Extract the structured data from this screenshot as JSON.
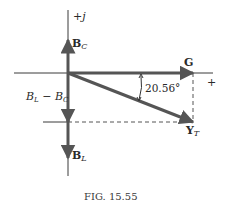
{
  "figure": {
    "caption": "FIG. 15.55",
    "axes": {
      "imag_label": "+j",
      "real_label": "+"
    },
    "vectors": {
      "bc": {
        "main": "B",
        "sub": "C"
      },
      "bl": {
        "main": "B",
        "sub": "L"
      },
      "g": {
        "main": "G"
      },
      "yt": {
        "main": "Y",
        "sub": "T"
      }
    },
    "difference_label": "B_L − B_C",
    "difference": {
      "b1": "B",
      "s1": "L",
      "op": " − ",
      "b2": "B",
      "s2": "C"
    },
    "angle_label": "20.56°",
    "colors": {
      "vector": "#555555",
      "axis": "#3a3a3a",
      "background": "#ffffff"
    }
  }
}
